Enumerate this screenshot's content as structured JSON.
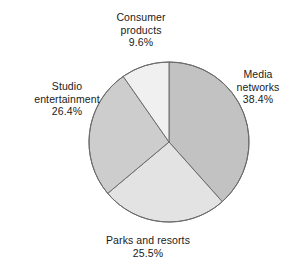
{
  "chart_data": {
    "type": "pie",
    "title": "",
    "subtitle": "",
    "xlabel": "",
    "ylabel": "",
    "legend": "none",
    "grid": false,
    "labels_position": "outside",
    "value_unit": "percent",
    "categories": [
      "Media networks",
      "Parks and resorts",
      "Studio entertainment",
      "Consumer products"
    ],
    "values": [
      38.4,
      25.5,
      26.4,
      9.6
    ],
    "value_labels": [
      "38.4%",
      "25.5%",
      "26.4%",
      "9.6%"
    ],
    "start_angle_deg": 0,
    "direction": "clockwise",
    "slices": [
      {
        "name": "Media networks",
        "label_lines": [
          "Media",
          "networks"
        ],
        "value": 38.4,
        "value_label": "38.4%",
        "color": "#c2c2c2",
        "start_deg": 0,
        "end_deg": 138.24
      },
      {
        "name": "Parks and resorts",
        "label_lines": [
          "Parks and resorts"
        ],
        "value": 25.5,
        "value_label": "25.5%",
        "color": "#e3e3e3",
        "start_deg": 138.24,
        "end_deg": 230.04
      },
      {
        "name": "Studio entertainment",
        "label_lines": [
          "Studio",
          "entertainment"
        ],
        "value": 26.4,
        "value_label": "26.4%",
        "color": "#cdcdcd",
        "start_deg": 230.04,
        "end_deg": 325.08
      },
      {
        "name": "Consumer products",
        "label_lines": [
          "Consumer",
          "products"
        ],
        "value": 9.6,
        "value_label": "9.6%",
        "color": "#f0f0f0",
        "start_deg": 325.08,
        "end_deg": 360
      }
    ],
    "geometry": {
      "center_x": 169,
      "center_y": 142,
      "radius": 80,
      "stroke_color": "#6b6b6b",
      "stroke_width": 1,
      "background": "#ffffff"
    }
  },
  "labels": {
    "consumer_products": {
      "line1": "Consumer",
      "line2": "products",
      "percent": "9.6%"
    },
    "media_networks": {
      "line1": "Media",
      "line2": "networks",
      "percent": "38.4%"
    },
    "studio_entertainment": {
      "line1": "Studio",
      "line2": "entertainment",
      "percent": "26.4%"
    },
    "parks_and_resorts": {
      "line1": "Parks and resorts",
      "percent": "25.5%"
    }
  }
}
